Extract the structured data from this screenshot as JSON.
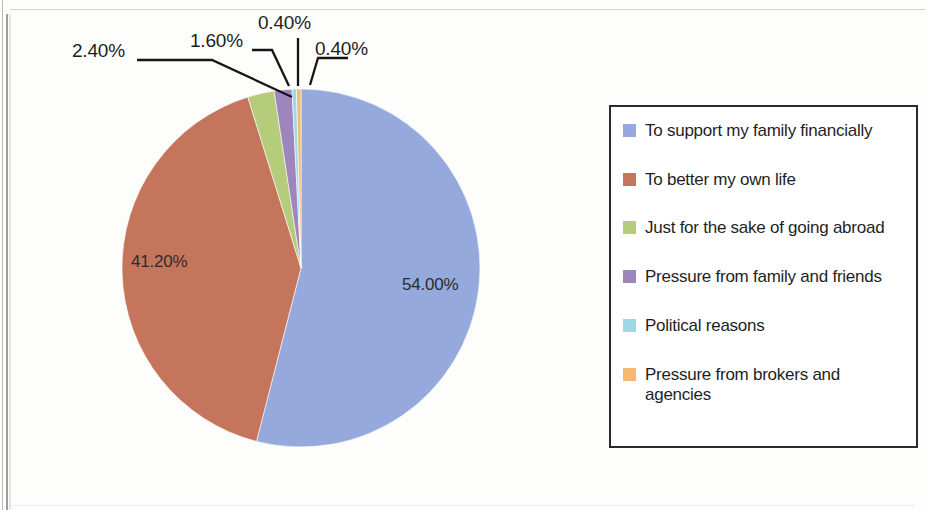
{
  "chart_data": {
    "type": "pie",
    "title": "",
    "subtitle": "",
    "legend_position": "right",
    "start_angle_deg": 0,
    "direction": "clockwise",
    "categories": [
      "To support my family financially",
      "To better my own life",
      "Just for the sake of going abroad",
      "Pressure from family and friends",
      "Political reasons",
      "Pressure from brokers and agencies"
    ],
    "values": [
      54.0,
      41.2,
      2.4,
      1.6,
      0.4,
      0.4
    ],
    "value_labels": [
      "54.00%",
      "41.20%",
      "2.40%",
      "1.60%",
      "0.40%",
      "0.40%"
    ],
    "colors": [
      "#95a9dc",
      "#c4755b",
      "#b5cc7a",
      "#9f85be",
      "#9ed8e8",
      "#f5b971"
    ],
    "units": "percent",
    "total": 100.0
  },
  "pie": {
    "center_x": 180,
    "center_y": 180,
    "radius": 179,
    "slices": [
      {
        "label": "To support my family financially",
        "value": 54.0,
        "color": "#95a9dc",
        "value_label": "54.00%"
      },
      {
        "label": "To better my own life",
        "value": 41.2,
        "color": "#c4755b",
        "value_label": "41.20%"
      },
      {
        "label": "Just for the sake of going abroad",
        "value": 2.4,
        "color": "#b5cc7a",
        "value_label": "2.40%"
      },
      {
        "label": "Pressure from family and friends",
        "value": 1.6,
        "color": "#9f85be",
        "value_label": "1.60%"
      },
      {
        "label": "Political reasons",
        "value": 0.4,
        "color": "#9ed8e8",
        "value_label": "0.40%"
      },
      {
        "label": "Pressure from brokers and agencies",
        "value": 0.4,
        "color": "#f5b971",
        "value_label": "0.40%"
      }
    ]
  },
  "labels": {
    "inside_blue": "54.00%",
    "inside_red": "41.20%",
    "callout_green": "2.40%",
    "callout_purple": "1.60%",
    "callout_cyan": "0.40%",
    "callout_orange": "0.40%"
  },
  "legend": {
    "items": [
      {
        "label": "To support my family financially",
        "color": "#95a9dc"
      },
      {
        "label": "To better my own life",
        "color": "#c4755b"
      },
      {
        "label": "Just for the sake of going abroad",
        "color": "#b5cc7a"
      },
      {
        "label": "Pressure from family and friends",
        "color": "#9f85be"
      },
      {
        "label": "Political reasons",
        "color": "#9ed8e8"
      },
      {
        "label": "Pressure from brokers and agencies",
        "color": "#f5b971"
      }
    ]
  }
}
